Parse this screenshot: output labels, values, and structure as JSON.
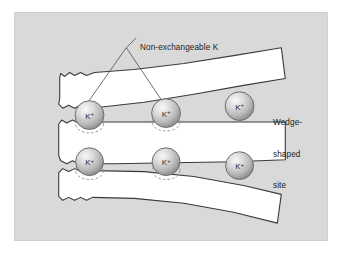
{
  "figure": {
    "panel_background": "#d9d9d9",
    "page_background": "#ffffff",
    "border_color": "#cfcfcf"
  },
  "labels": {
    "non_exchangeable": "Non-exchangeable K",
    "wedge_line1": "Wedge-",
    "wedge_line2": "shaped",
    "wedge_line3": "site"
  },
  "ions": {
    "symbol": "K",
    "charge": "+",
    "fill_light": "#f2f2f2",
    "fill_mid": "#c8c8c8",
    "fill_dark": "#9a9a9a",
    "stroke": "#6e6e6e",
    "text_color": "#2a2a2a",
    "positions": [
      {
        "id": "ion-top-left",
        "cx": 89,
        "cy": 115,
        "r": 14.5
      },
      {
        "id": "ion-top-middle",
        "cx": 166,
        "cy": 113,
        "r": 14.5
      },
      {
        "id": "ion-top-right",
        "cx": 240,
        "cy": 106,
        "r": 14.5
      },
      {
        "id": "ion-bottom-left",
        "cx": 89,
        "cy": 162,
        "r": 14.0
      },
      {
        "id": "ion-bottom-mid",
        "cx": 166,
        "cy": 162,
        "r": 14.0
      },
      {
        "id": "ion-bottom-right",
        "cx": 240,
        "cy": 166,
        "r": 14.0
      }
    ]
  },
  "vacant_sites": {
    "dash_stroke": "#8f8f8f",
    "positions": [
      {
        "id": "vacancy-top-left",
        "cx": 89,
        "cy": 124,
        "rx": 14,
        "ry": 9
      },
      {
        "id": "vacancy-top-middle",
        "cx": 166,
        "cy": 122,
        "rx": 14,
        "ry": 9
      },
      {
        "id": "vacancy-bot-left",
        "cx": 89,
        "cy": 171,
        "rx": 14,
        "ry": 9
      },
      {
        "id": "vacancy-bot-middle",
        "cx": 166,
        "cy": 171,
        "rx": 14,
        "ry": 9
      }
    ]
  },
  "layers": {
    "fill": "#ffffff",
    "stroke": "#3a3a3a",
    "count": 3,
    "description": "white curved mineral sheets with torn left edges"
  },
  "leader_lines": {
    "stroke": "#555555",
    "apex_x": 126,
    "apex_y": 47,
    "targets": [
      {
        "x": 86,
        "y": 104
      },
      {
        "x": 163,
        "y": 102
      }
    ],
    "stub": {
      "x1": 127,
      "y1": 35,
      "x2": 136,
      "y2": 35
    }
  }
}
